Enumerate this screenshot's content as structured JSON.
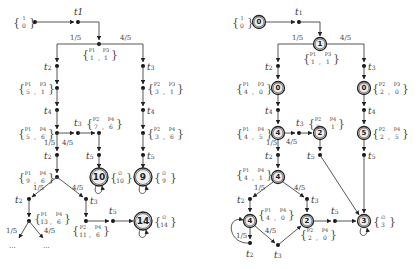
{
  "left_diagram": {
    "initial_marking": {
      "top": "1",
      "bottom": "0"
    },
    "transitions": {
      "t1": "t1",
      "t2": "t2",
      "t3": "t3",
      "t4": "t4",
      "t5": "t5"
    },
    "probabilities": {
      "low": "1/5",
      "high": "4/5"
    },
    "markings": [
      {
        "id": "m_p1p3_1_1",
        "p_top": [
          "P1",
          "P3"
        ],
        "values": [
          "1",
          "1"
        ]
      },
      {
        "id": "m_p1p3_5_1",
        "p_top": [
          "P1",
          "P3"
        ],
        "values": [
          "5",
          "1"
        ]
      },
      {
        "id": "m_p2p3_3_1",
        "p_top": [
          "P2",
          "P3"
        ],
        "values": [
          "3",
          "1"
        ]
      },
      {
        "id": "m_p1p4_5_6",
        "p_top": [
          "P1",
          "P4"
        ],
        "values": [
          "5",
          "6"
        ]
      },
      {
        "id": "m_p2p4_7_6",
        "p_top": [
          "P2",
          "P4"
        ],
        "values": [
          "7",
          "6"
        ]
      },
      {
        "id": "m_p2p4_3_6",
        "p_top": [
          "P2",
          "P4"
        ],
        "values": [
          "3",
          "6"
        ]
      },
      {
        "id": "m_p1p4_9_6",
        "p_top": [
          "P1",
          "P4"
        ],
        "values": [
          "9",
          "6"
        ]
      },
      {
        "id": "m_p1p4_13_6",
        "p_top": [
          "P1",
          "P4"
        ],
        "values": [
          "13",
          "6"
        ]
      },
      {
        "id": "m_p2p4_11_6",
        "p_top": [
          "P2",
          "P4"
        ],
        "values": [
          "11",
          "6"
        ]
      }
    ],
    "terminal_states": [
      {
        "label": "10",
        "marking_top": "∅",
        "marking_bottom": "10"
      },
      {
        "label": "9",
        "marking_top": "∅",
        "marking_bottom": "9"
      },
      {
        "label": "14",
        "marking_top": "∅",
        "marking_bottom": "14"
      }
    ],
    "ellipsis": "..."
  },
  "right_diagram": {
    "initial_marking": {
      "top": "1",
      "bottom": "0"
    },
    "states": {
      "s_init": "0",
      "s_split": "1",
      "s_left1": "0",
      "s_right1": "0",
      "s_left2": "4",
      "s_mid2": "2",
      "s_right2": "5",
      "s_left3": "4",
      "s_left4": "4",
      "s_mid4": "2",
      "s_final": "3"
    },
    "markings": [
      {
        "id": "r_p1p3_1_1",
        "p_top": [
          "P1",
          "P3"
        ],
        "values": [
          "1",
          "1"
        ]
      },
      {
        "id": "r_p1p3_4_0",
        "p_top": [
          "P1",
          "P3"
        ],
        "values": [
          "4",
          "0"
        ]
      },
      {
        "id": "r_p2p3_2_0",
        "p_top": [
          "P2",
          "P3"
        ],
        "values": [
          "2",
          "0"
        ]
      },
      {
        "id": "r_p1p4_4_5",
        "p_top": [
          "P1",
          "P4"
        ],
        "values": [
          "4",
          "5"
        ]
      },
      {
        "id": "r_p2p4_2_1",
        "p_top": [
          "P2",
          "P4"
        ],
        "values": [
          "2",
          "1"
        ]
      },
      {
        "id": "r_p2p4_2_5",
        "p_top": [
          "P2",
          "P4"
        ],
        "values": [
          "2",
          "5"
        ]
      },
      {
        "id": "r_p1p4_4_1",
        "p_top": [
          "P1",
          "P4"
        ],
        "values": [
          "4",
          "1"
        ]
      },
      {
        "id": "r_p1p4_4_0",
        "p_top": [
          "P1",
          "P4"
        ],
        "values": [
          "4",
          "0"
        ]
      },
      {
        "id": "r_p2p4_2_0",
        "p_top": [
          "P2",
          "P4"
        ],
        "values": [
          "2",
          "0"
        ]
      }
    ],
    "final_marking": {
      "top": "∅",
      "bottom": "3"
    }
  }
}
